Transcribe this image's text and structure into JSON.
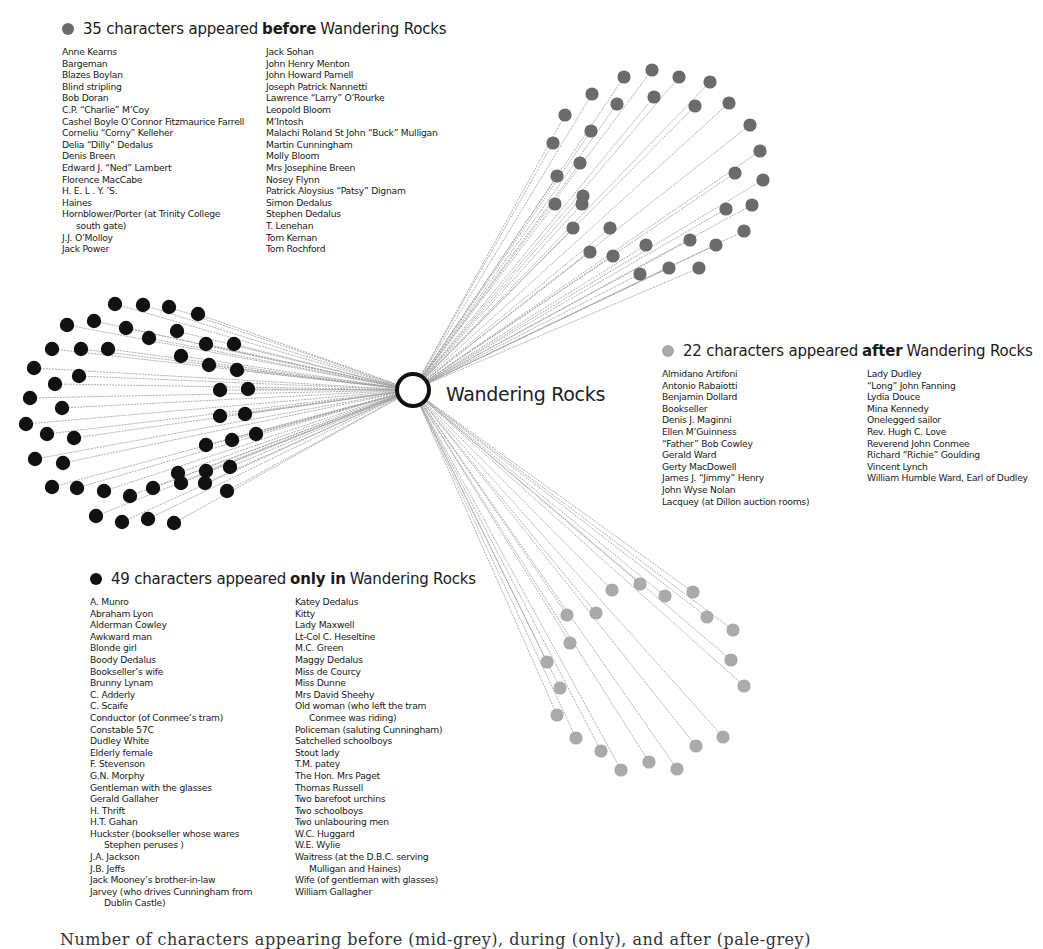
{
  "center": {
    "label": "Wandering Rocks",
    "x": 413,
    "y": 390
  },
  "colors": {
    "before": "#6b6b6b",
    "after": "#aaaaaa",
    "only": "#111111",
    "edge": "#9a9a9a"
  },
  "before": {
    "count": "35 characters appeared",
    "keyword": "before",
    "suffix": "Wandering Rocks",
    "col1": [
      "Anne Kearns",
      "Bargeman",
      "Blazes Boylan",
      "Blind stripling",
      "Bob Doran",
      "C.P. “Charlie” M’Coy",
      "Cashel Boyle O’Connor Fitzmaurice Farrell",
      "Corneliu “Corny” Kelleher",
      "Delia “Dilly” Dedalus",
      "Denis Breen",
      "Edward J. “Ned” Lambert",
      "Florence MacCabe",
      "H. E. L . Y. ’S.",
      "Haines",
      "Hornblower/Porter (at Trinity College",
      "south gate)",
      "J.J. O’Molloy",
      "Jack Power"
    ],
    "col2": [
      "Jack Sohan",
      "John Henry Menton",
      "John Howard Parnell",
      "Joseph Patrick Nannetti",
      "Lawrence “Larry” O’Rourke",
      "Leopold Bloom",
      "M’Intosh",
      "Malachi Roland St John “Buck” Mulligan",
      "Martin Cunningham",
      "Molly Bloom",
      "Mrs Josephine Breen",
      "Nosey Flynn",
      "Patrick Aloysius “Patsy” Dignam",
      "Simon Dedalus",
      "Stephen Dedalus",
      "T. Lenehan",
      "Tom Kernan",
      "Tom Rochford"
    ]
  },
  "after": {
    "count": "22 characters appeared",
    "keyword": "after",
    "suffix": "Wandering Rocks",
    "col1": [
      "Almidano Artifoni",
      "Antonio Rabaiotti",
      "Benjamin Dollard",
      "Bookseller",
      "Denis J. Maginni",
      "Ellen M’Guinness",
      "“Father” Bob Cowley",
      "Gerald Ward",
      "Gerty MacDowell",
      "James J. “Jimmy” Henry",
      "John Wyse Nolan",
      "Lacquey (at Dillon auction rooms)"
    ],
    "col2": [
      "Lady Dudley",
      "“Long” John Fanning",
      "Lydia Douce",
      "Mina Kennedy",
      "Onelegged sailor",
      "Rev. Hugh C. Love",
      "Reverend John Conmee",
      "Richard “Richie” Goulding",
      "Vincent Lynch",
      "William Humble Ward, Earl of Dudley"
    ]
  },
  "only": {
    "count": "49 characters appeared",
    "keyword": "only in",
    "suffix": "Wandering Rocks",
    "col1": [
      "A. Munro",
      "Abraham Lyon",
      "Alderman Cowley",
      "Awkward man",
      "Blonde girl",
      "Boody Dedalus",
      "Bookseller’s wife",
      "Brunny Lynam",
      "C. Adderly",
      "C. Scaife",
      "Conductor (of Conmee’s tram)",
      "Constable 57C",
      "Dudley White",
      "Elderly female",
      "F. Stevenson",
      "G.N. Morphy",
      "Gentleman with the glasses",
      "Gerald Gallaher",
      "H. Thrift",
      "H.T. Gahan",
      "Huckster (bookseller whose wares",
      "Stephen peruses )",
      "J.A. Jackson",
      "J.B. Jeffs",
      "Jack Mooney’s brother-in-law",
      "Jarvey (who drives Cunningham from",
      "Dublin Castle)"
    ],
    "col2": [
      "Katey Dedalus",
      "Kitty",
      "Lady Maxwell",
      "Lt-Col C. Heseltine",
      "M.C. Green",
      "Maggy Dedalus",
      "Miss de Courcy",
      "Miss Dunne",
      "Mrs David Sheehy",
      "Old woman (who left the tram",
      "Conmee was riding)",
      "Policeman (saluting Cunningham)",
      "Satchelled schoolboys",
      "Stout lady",
      "T.M. patey",
      "The Hon. Mrs Paget",
      "Thomas Russell",
      "Two barefoot urchins",
      "Two schoolboys",
      "Two unlabouring men",
      "W.C. Huggard",
      "W.E. Wylie",
      "Waitress (at the D.B.C. serving",
      "Mulligan and Haines)",
      "Wife (of gentleman with glasses)",
      "William Gallagher"
    ]
  },
  "caption": "Number of characters appearing before (mid-grey), during (only), and after (pale-grey)",
  "nodes": {
    "before": [
      [
        624,
        77
      ],
      [
        652,
        70
      ],
      [
        679,
        77
      ],
      [
        710,
        82
      ],
      [
        592,
        94
      ],
      [
        617,
        104
      ],
      [
        654,
        97
      ],
      [
        695,
        106
      ],
      [
        729,
        103
      ],
      [
        565,
        115
      ],
      [
        591,
        131
      ],
      [
        750,
        125
      ],
      [
        553,
        143
      ],
      [
        580,
        163
      ],
      [
        760,
        151
      ],
      [
        557,
        176
      ],
      [
        583,
        196
      ],
      [
        735,
        173
      ],
      [
        763,
        180
      ],
      [
        555,
        204
      ],
      [
        582,
        204
      ],
      [
        726,
        209
      ],
      [
        752,
        205
      ],
      [
        573,
        228
      ],
      [
        610,
        228
      ],
      [
        744,
        231
      ],
      [
        590,
        252
      ],
      [
        613,
        256
      ],
      [
        646,
        245
      ],
      [
        690,
        240
      ],
      [
        716,
        245
      ],
      [
        640,
        274
      ],
      [
        669,
        268
      ],
      [
        699,
        268
      ]
    ],
    "after": [
      [
        612,
        590
      ],
      [
        640,
        584
      ],
      [
        665,
        596
      ],
      [
        693,
        592
      ],
      [
        707,
        617
      ],
      [
        733,
        630
      ],
      [
        731,
        660
      ],
      [
        744,
        686
      ],
      [
        567,
        615
      ],
      [
        596,
        613
      ],
      [
        570,
        643
      ],
      [
        547,
        662
      ],
      [
        560,
        688
      ],
      [
        557,
        715
      ],
      [
        576,
        738
      ],
      [
        601,
        751
      ],
      [
        621,
        770
      ],
      [
        649,
        762
      ],
      [
        677,
        769
      ],
      [
        696,
        746
      ],
      [
        723,
        737
      ]
    ],
    "only": [
      [
        115,
        304
      ],
      [
        143,
        305
      ],
      [
        169,
        307
      ],
      [
        198,
        314
      ],
      [
        94,
        321
      ],
      [
        67,
        325
      ],
      [
        126,
        328
      ],
      [
        149,
        338
      ],
      [
        177,
        331
      ],
      [
        206,
        344
      ],
      [
        234,
        344
      ],
      [
        52,
        349
      ],
      [
        81,
        349
      ],
      [
        108,
        349
      ],
      [
        181,
        356
      ],
      [
        209,
        365
      ],
      [
        237,
        370
      ],
      [
        34,
        368
      ],
      [
        55,
        384
      ],
      [
        79,
        376
      ],
      [
        220,
        390
      ],
      [
        248,
        389
      ],
      [
        30,
        398
      ],
      [
        62,
        408
      ],
      [
        220,
        416
      ],
      [
        245,
        414
      ],
      [
        26,
        424
      ],
      [
        47,
        434
      ],
      [
        74,
        438
      ],
      [
        206,
        445
      ],
      [
        232,
        440
      ],
      [
        256,
        434
      ],
      [
        35,
        459
      ],
      [
        63,
        463
      ],
      [
        178,
        473
      ],
      [
        206,
        471
      ],
      [
        230,
        467
      ],
      [
        52,
        487
      ],
      [
        77,
        488
      ],
      [
        104,
        491
      ],
      [
        130,
        496
      ],
      [
        153,
        488
      ],
      [
        181,
        483
      ],
      [
        205,
        483
      ],
      [
        227,
        491
      ],
      [
        96,
        516
      ],
      [
        122,
        522
      ],
      [
        148,
        519
      ],
      [
        174,
        523
      ]
    ]
  }
}
